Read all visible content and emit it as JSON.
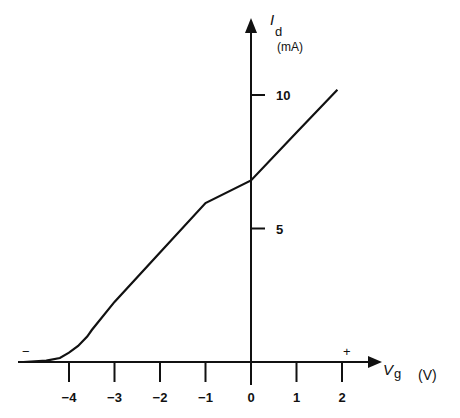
{
  "chart_data": {
    "type": "line",
    "title": "",
    "xlabel": "Vg",
    "xunit": "(V)",
    "ylabel": "Id",
    "yunit": "(mA)",
    "xlim": [
      -5,
      2.3
    ],
    "ylim": [
      0,
      12
    ],
    "x_ticks": [
      -4,
      -3,
      -2,
      -1,
      0,
      1,
      2
    ],
    "x_tick_labels": [
      "−4",
      "−3",
      "−2",
      "−1",
      "0",
      "1",
      "2"
    ],
    "y_ticks": [
      5,
      10
    ],
    "y_tick_labels": [
      "5",
      "10"
    ],
    "grid": false,
    "annotations": {
      "negative_sign": "−",
      "positive_sign": "+"
    },
    "series": [
      {
        "name": "Id vs Vg",
        "x": [
          -5.0,
          -4.5,
          -4.2,
          -4.0,
          -3.8,
          -3.6,
          -3.5,
          -3.0,
          -2.0,
          -1.0,
          0.0,
          1.0,
          1.9
        ],
        "y": [
          0.0,
          0.05,
          0.15,
          0.35,
          0.6,
          0.95,
          1.2,
          2.25,
          4.1,
          5.95,
          6.8,
          8.6,
          10.2
        ]
      }
    ]
  },
  "axes": {
    "y_label_main": "I",
    "y_label_sub": "d",
    "y_unit": "(mA)",
    "x_label_main": "V",
    "x_label_sub": "g",
    "x_unit": "(V)",
    "minus_sign": "−",
    "plus_sign": "+"
  }
}
